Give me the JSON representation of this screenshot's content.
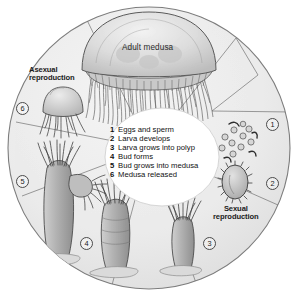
{
  "figure": {
    "title_label": "Adult medusa",
    "asexual_label": "Asexual\nreproduction",
    "sexual_label": "Sexual\nreproduction",
    "background_color": "#ffffff",
    "circle_fill": "#ececec",
    "circle_stroke": "#808080",
    "organism_fill": "#b9b9b9",
    "organism_stroke": "#4a4a4a",
    "panel_fill": "#ffffff",
    "text_color": "#111111"
  },
  "legend": {
    "items": [
      {
        "num": "1",
        "text": "Eggs and sperm"
      },
      {
        "num": "2",
        "text": "Larva develops"
      },
      {
        "num": "3",
        "text": "Larva grows into polyp"
      },
      {
        "num": "4",
        "text": "Bud forms"
      },
      {
        "num": "5",
        "text": "Bud grows into medusa"
      },
      {
        "num": "6",
        "text": "Medusa released"
      }
    ]
  },
  "markers": [
    {
      "id": "1",
      "label": "1"
    },
    {
      "id": "2",
      "label": "2"
    },
    {
      "id": "3",
      "label": "3"
    },
    {
      "id": "4",
      "label": "4"
    },
    {
      "id": "5",
      "label": "5"
    },
    {
      "id": "6",
      "label": "6"
    }
  ],
  "stages": [
    {
      "id": "adult-medusa",
      "name": "Adult medusa"
    },
    {
      "id": "eggs-and-sperm",
      "name": "Eggs and sperm"
    },
    {
      "id": "larva",
      "name": "Planula larva"
    },
    {
      "id": "young-polyp",
      "name": "Young polyp"
    },
    {
      "id": "budding-polyp",
      "name": "Budding polyp"
    },
    {
      "id": "polyp-with-medusa-bud",
      "name": "Polyp with medusa bud"
    },
    {
      "id": "released-medusa",
      "name": "Released juvenile medusa"
    }
  ]
}
